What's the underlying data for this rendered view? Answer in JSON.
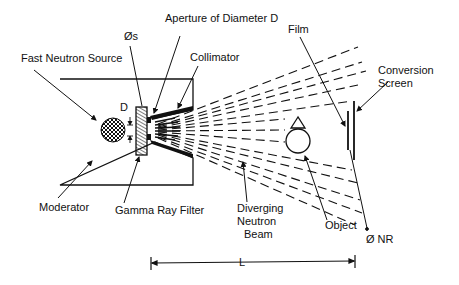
{
  "diagram": {
    "labels": {
      "fast_neutron_source": "Fast Neutron Source",
      "phi_s": "Øs",
      "aperture": "Aperture of Diameter D",
      "collimator": "Collimator",
      "film": "Film",
      "conversion_screen_line1": "Conversion",
      "conversion_screen_line2": "Screen",
      "d": "D",
      "moderator": "Moderator",
      "gamma_ray_filter": "Gamma Ray Filter",
      "beam_line1": "Diverging",
      "beam_line2": "Neutron",
      "beam_line3": "Beam",
      "object": "Object",
      "phi_nr": "Ø NR",
      "length": "L"
    },
    "colors": {
      "ink": "#111111",
      "background": "#ffffff"
    }
  }
}
